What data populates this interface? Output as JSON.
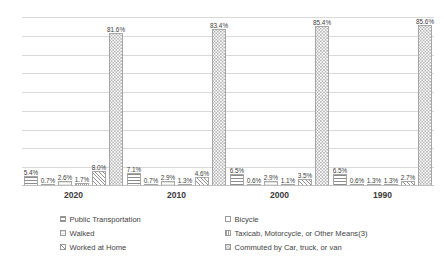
{
  "chart_data": {
    "type": "bar",
    "title": "",
    "subtitle": "",
    "xlabel": "",
    "ylabel": "",
    "categories": [
      "2020",
      "2010",
      "2000",
      "1990"
    ],
    "ylim": [
      0,
      90
    ],
    "y_gridline_values": [
      0,
      10,
      20,
      30,
      40,
      50,
      60,
      70,
      80,
      90
    ],
    "grid": true,
    "y_tick_labels_shown": false,
    "legend_position": "bottom",
    "value_suffix": "%",
    "series": [
      {
        "name": "Public Transportation",
        "pattern": "horizontal-lines",
        "values": [
          5.4,
          7.1,
          6.5,
          6.5
        ],
        "labels": [
          "5.4%",
          "7.1%",
          "6.5%",
          "6.5%"
        ]
      },
      {
        "name": "Bicycle",
        "pattern": "solid-light",
        "values": [
          0.7,
          0.7,
          0.6,
          0.6
        ],
        "labels": [
          "0.7%",
          "0.7%",
          "0.6%",
          "0.6%"
        ]
      },
      {
        "name": "Walked",
        "pattern": "light-speckle",
        "values": [
          2.6,
          2.9,
          2.9,
          1.3
        ],
        "labels": [
          "2.6%",
          "2.9%",
          "2.9%",
          "1.3%"
        ]
      },
      {
        "name": "Taxicab, Motorcycle, or Other Means(3)",
        "pattern": "vertical-lines",
        "values": [
          1.7,
          1.3,
          1.1,
          1.3
        ],
        "labels": [
          "1.7%",
          "1.3%",
          "1.1%",
          "1.3%"
        ]
      },
      {
        "name": "Worked at Home",
        "pattern": "diagonal-hatch",
        "values": [
          8.0,
          4.6,
          3.5,
          2.7
        ],
        "labels": [
          "8.0%",
          "4.6%",
          "3.5%",
          "2.7%"
        ]
      },
      {
        "name": "Commuted by Car, truck, or van",
        "pattern": "dotted-checker",
        "values": [
          81.6,
          83.4,
          85.4,
          85.6
        ],
        "labels": [
          "81.6%",
          "83.4%",
          "85.4%",
          "85.6%"
        ]
      }
    ]
  },
  "legend": {
    "left_column": [
      {
        "label": "Public Transportation",
        "series_index": 0
      },
      {
        "label": "Walked",
        "series_index": 2
      },
      {
        "label": "Worked at Home",
        "series_index": 4
      }
    ],
    "right_column": [
      {
        "label": "Bicycle",
        "series_index": 1
      },
      {
        "label": "Taxicab, Motorcycle, or Other Means(3)",
        "series_index": 3
      },
      {
        "label": "Commuted by Car, truck, or van",
        "series_index": 5
      }
    ]
  },
  "colors": {
    "gridline": "#d9d9d9",
    "baseline": "#bfbfbf",
    "bar_border": "#a6a6a6",
    "text": "#3f3f3f",
    "background": "#ffffff"
  }
}
